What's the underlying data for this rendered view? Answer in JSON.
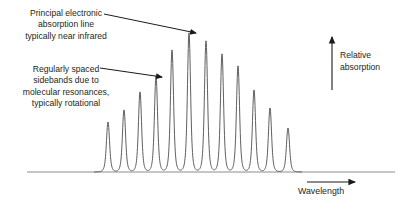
{
  "figure": {
    "title_present": false,
    "background_color": "#ffffff",
    "width": 402,
    "height": 210
  },
  "annotations": {
    "principal": {
      "lines": [
        "Principal electronic",
        "absorption line",
        "typically near infrared"
      ],
      "text": "Principal electronic absorption line typically near infrared",
      "arrow": {
        "from_x": 104,
        "from_y": 14,
        "to_x": 196,
        "to_y": 33
      }
    },
    "sidebands": {
      "lines": [
        "Regularly spaced",
        "sidebands due to",
        "molecular resonances,",
        "typically rotational"
      ],
      "text": "Regularly spaced sidebands due to molecular resonances, typically rotational",
      "arrow": {
        "from_x": 100,
        "from_y": 68,
        "to_x": 163,
        "to_y": 77
      }
    },
    "y_axis_label": {
      "lines": [
        "Relative",
        "absorption"
      ],
      "text": "Relative absorption",
      "arrow": {
        "from_x": 332,
        "from_y": 90,
        "to_x": 332,
        "to_y": 36
      }
    },
    "x_axis_label": {
      "lines": [
        "Wavelength"
      ],
      "text": "Wavelength",
      "arrow": {
        "from_x": 307,
        "from_y": 182,
        "to_x": 356,
        "to_y": 182
      }
    }
  },
  "colors": {
    "ink": "#231f20",
    "curve": "#4d4d4d",
    "baseline": "#808080",
    "arrow": "#1a1a1a"
  },
  "chart_data": {
    "type": "line",
    "title": "",
    "xlabel": "Wavelength",
    "ylabel": "Relative absorption",
    "grid": false,
    "legend": null,
    "axes": {
      "baseline_y_px": 172,
      "baseline_x_start_px": 27,
      "baseline_x_end_px": 395,
      "x_axis_visible": true,
      "y_axis_visible": false,
      "tick_labels_x": [],
      "tick_labels_y": []
    },
    "peaks": [
      {
        "index": 1,
        "x_px": 108,
        "height_px": 50,
        "relative_absorption": 0.36
      },
      {
        "index": 2,
        "x_px": 124,
        "height_px": 62,
        "relative_absorption": 0.45
      },
      {
        "index": 3,
        "x_px": 140,
        "height_px": 80,
        "relative_absorption": 0.58
      },
      {
        "index": 4,
        "x_px": 156,
        "height_px": 96,
        "relative_absorption": 0.69
      },
      {
        "index": 5,
        "x_px": 172,
        "height_px": 122,
        "relative_absorption": 0.88
      },
      {
        "index": 6,
        "x_px": 189,
        "height_px": 139,
        "relative_absorption": 1.0
      },
      {
        "index": 7,
        "x_px": 206,
        "height_px": 131,
        "relative_absorption": 0.94
      },
      {
        "index": 8,
        "x_px": 222,
        "height_px": 118,
        "relative_absorption": 0.85
      },
      {
        "index": 9,
        "x_px": 238,
        "height_px": 106,
        "relative_absorption": 0.76
      },
      {
        "index": 10,
        "x_px": 254,
        "height_px": 82,
        "relative_absorption": 0.59
      },
      {
        "index": 11,
        "x_px": 270,
        "height_px": 64,
        "relative_absorption": 0.46
      },
      {
        "index": 12,
        "x_px": 288,
        "height_px": 44,
        "relative_absorption": 0.32
      }
    ],
    "peak_spacing_px": 16.3,
    "peak_width_px": 5.2,
    "principal_peak_index": 6,
    "n_peaks": 12
  }
}
